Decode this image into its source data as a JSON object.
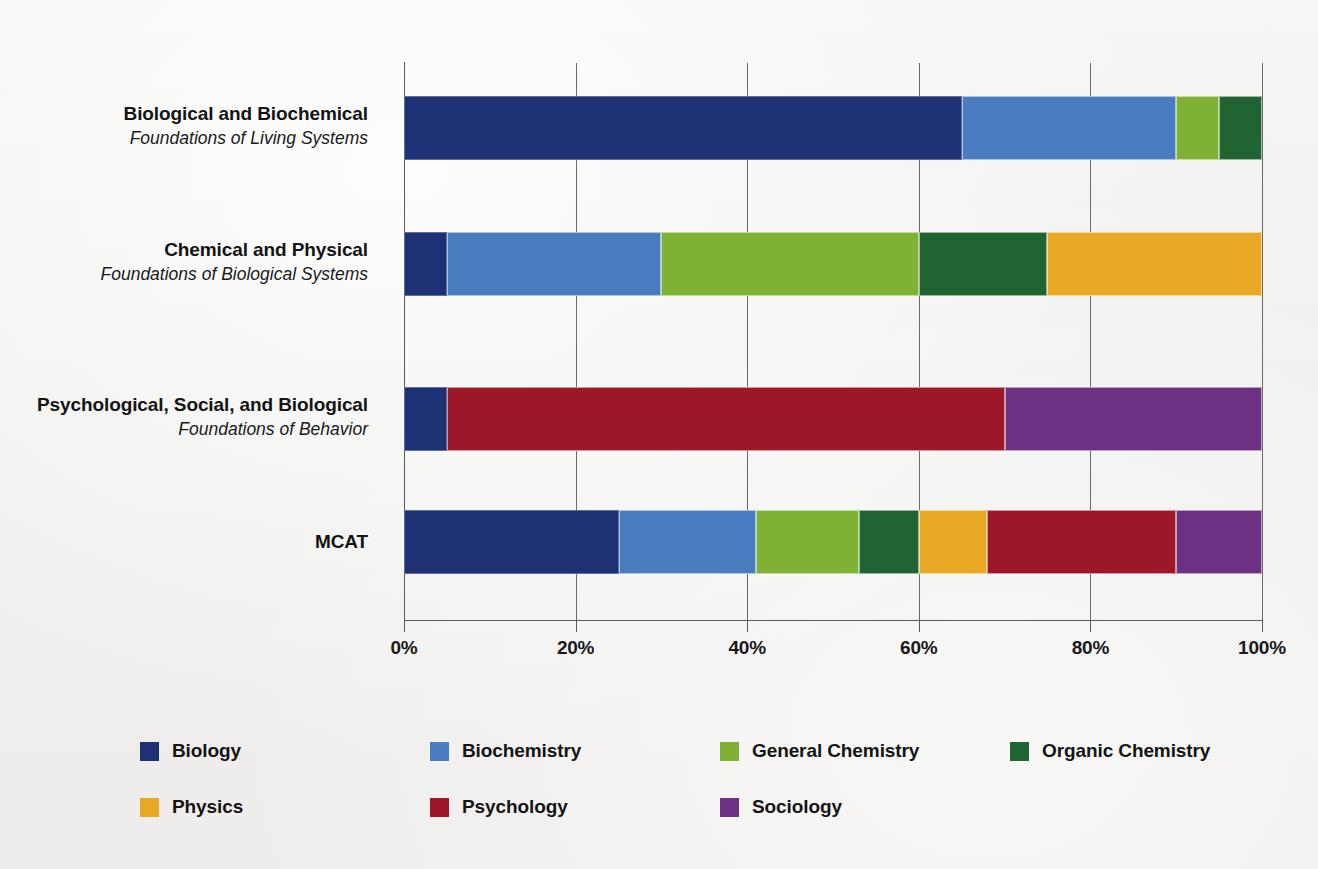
{
  "chart_data": {
    "type": "bar",
    "subtype": "horizontal-stacked-100-percent",
    "title": "",
    "xlabel": "",
    "ylabel": "",
    "xlim": [
      0,
      100
    ],
    "xticks": [
      0,
      20,
      40,
      60,
      80,
      100
    ],
    "xtick_labels": [
      "0%",
      "20%",
      "40%",
      "60%",
      "80%",
      "100%"
    ],
    "grid": true,
    "grid_axis": "x",
    "legend_position": "bottom",
    "categories": [
      {
        "title": "Biological and Biochemical",
        "subtitle": "Foundations of Living Systems"
      },
      {
        "title": "Chemical and Physical",
        "subtitle": "Foundations of Biological Systems"
      },
      {
        "title": "Psychological, Social, and Biological",
        "subtitle": "Foundations of Behavior"
      },
      {
        "title": "MCAT",
        "subtitle": ""
      }
    ],
    "series": [
      {
        "name": "Biology",
        "color": "#1f3175",
        "values": [
          65,
          5,
          5,
          25
        ]
      },
      {
        "name": "Biochemistry",
        "color": "#4a7cc0",
        "values": [
          25,
          25,
          0,
          16
        ]
      },
      {
        "name": "General Chemistry",
        "color": "#7fb135",
        "values": [
          5,
          30,
          0,
          12
        ]
      },
      {
        "name": "Organic Chemistry",
        "color": "#206433",
        "values": [
          5,
          15,
          0,
          7
        ]
      },
      {
        "name": "Physics",
        "color": "#e8a823",
        "values": [
          0,
          25,
          0,
          8
        ]
      },
      {
        "name": "Psychology",
        "color": "#9c1728",
        "values": [
          0,
          0,
          65,
          22
        ]
      },
      {
        "name": "Sociology",
        "color": "#6d3183",
        "values": [
          0,
          0,
          30,
          10
        ]
      }
    ]
  },
  "legend": {
    "rows": [
      [
        {
          "label": "Biology",
          "color": "#1f3175"
        },
        {
          "label": "Biochemistry",
          "color": "#4a7cc0"
        },
        {
          "label": "General Chemistry",
          "color": "#7fb135"
        },
        {
          "label": "Organic Chemistry",
          "color": "#206433"
        }
      ],
      [
        {
          "label": "Physics",
          "color": "#e8a823"
        },
        {
          "label": "Psychology",
          "color": "#9c1728"
        },
        {
          "label": "Sociology",
          "color": "#6d3183"
        }
      ]
    ]
  },
  "colors": {
    "background": "#f1f1ef",
    "axis": "#5a5a5a",
    "text": "#141414"
  }
}
